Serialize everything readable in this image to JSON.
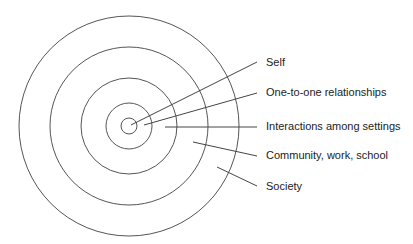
{
  "diagram": {
    "type": "concentric-circles",
    "center": {
      "x": 129,
      "y": 126
    },
    "rings": [
      {
        "name": "self",
        "radius": 8
      },
      {
        "name": "one-to-one-relationships",
        "radius": 23
      },
      {
        "name": "interactions-among-settings",
        "radius": 48
      },
      {
        "name": "community-work-school",
        "radius": 79
      },
      {
        "name": "society",
        "radius": 110
      }
    ],
    "labels": [
      {
        "text": "Self",
        "x": 266,
        "y": 56,
        "line": {
          "x1": 131,
          "y1": 125,
          "x2": 257,
          "y2": 62
        }
      },
      {
        "text": "One-to-one relationships",
        "x": 266,
        "y": 86,
        "line": {
          "x1": 144,
          "y1": 125,
          "x2": 257,
          "y2": 93
        }
      },
      {
        "text": "Interactions among settings",
        "x": 266,
        "y": 120,
        "line": {
          "x1": 165,
          "y1": 127,
          "x2": 257,
          "y2": 127
        }
      },
      {
        "text": "Community, work, school",
        "x": 266,
        "y": 149,
        "line": {
          "x1": 193,
          "y1": 142,
          "x2": 257,
          "y2": 156
        }
      },
      {
        "text": "Society",
        "x": 266,
        "y": 180,
        "line": {
          "x1": 217,
          "y1": 167,
          "x2": 257,
          "y2": 186
        }
      }
    ],
    "stroke_color": "#555555",
    "text_color": "#222222",
    "background": "#ffffff"
  }
}
